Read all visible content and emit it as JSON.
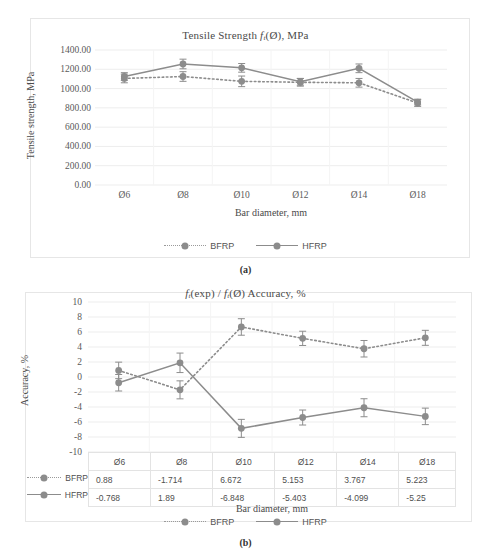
{
  "figure_a": {
    "caption": "(a)",
    "title_prefix": "Tensile Strength ",
    "title_f": "f",
    "title_sub": "t",
    "title_suffix": "(Ø), MPa",
    "xlabel": "Bar diameter, mm",
    "ylabel": "Tensile strength, MPa",
    "yticks": [
      "1400.00",
      "1200.00",
      "1000.00",
      "800.00",
      "600.00",
      "400.00",
      "200.00",
      "0.00"
    ],
    "xticks": [
      "Ø6",
      "Ø8",
      "Ø10",
      "Ø12",
      "Ø14",
      "Ø18"
    ],
    "legend": [
      {
        "label": "BFRP",
        "style": "dotted"
      },
      {
        "label": "HFRP",
        "style": "solid"
      }
    ]
  },
  "figure_b": {
    "caption": "(b)",
    "title_f1": "f",
    "title_sub1": "t",
    "title_mid": "(exp) / ",
    "title_f2": "f",
    "title_sub2": "t",
    "title_suffix": "(Ø) Accuracy, %",
    "xlabel": "Bar diameter, mm",
    "ylabel": "Accuracy, %",
    "yticks": [
      "10",
      "8",
      "6",
      "4",
      "2",
      "0",
      "-2",
      "-4",
      "-6",
      "-8",
      "-10"
    ],
    "categories": [
      "Ø6",
      "Ø8",
      "Ø10",
      "Ø12",
      "Ø14",
      "Ø18"
    ],
    "table_rows": [
      {
        "label": "BFRP",
        "style": "dotted",
        "values": [
          "0.88",
          "-1.714",
          "6.672",
          "5.153",
          "3.767",
          "5.223"
        ]
      },
      {
        "label": "HFRP",
        "style": "solid",
        "values": [
          "-0.768",
          "1.89",
          "-6.848",
          "-5.403",
          "-4.099",
          "-5.25"
        ]
      }
    ],
    "legend": [
      {
        "label": "BFRP",
        "style": "dotted"
      },
      {
        "label": "HFRP",
        "style": "solid"
      }
    ]
  },
  "colors": {
    "series": "#8c8c8c",
    "grid": "#ededed",
    "panel_border": "#e6e6e6",
    "text": "#4a4a4a"
  },
  "chart_data": [
    {
      "type": "line",
      "id": "a",
      "title": "Tensile Strength ft(Ø), MPa",
      "xlabel": "Bar diameter, mm",
      "ylabel": "Tensile strength, MPa",
      "categories": [
        "Ø6",
        "Ø8",
        "Ø10",
        "Ø12",
        "Ø14",
        "Ø18"
      ],
      "ylim": [
        0,
        1400
      ],
      "ytick_step": 200,
      "grid": true,
      "legend_position": "bottom",
      "series": [
        {
          "name": "BFRP",
          "style": "dotted",
          "values": [
            1105,
            1125,
            1075,
            1065,
            1060,
            850
          ],
          "error": [
            45,
            50,
            55,
            40,
            45,
            35
          ]
        },
        {
          "name": "HFRP",
          "style": "solid",
          "values": [
            1125,
            1255,
            1215,
            1070,
            1210,
            860
          ],
          "error": [
            40,
            50,
            45,
            35,
            45,
            30
          ]
        }
      ]
    },
    {
      "type": "line",
      "id": "b",
      "title": "ft(exp) / ft(Ø) Accuracy, %",
      "xlabel": "Bar diameter, mm",
      "ylabel": "Accuracy, %",
      "categories": [
        "Ø6",
        "Ø8",
        "Ø10",
        "Ø12",
        "Ø14",
        "Ø18"
      ],
      "ylim": [
        -10,
        10
      ],
      "ytick_step": 2,
      "grid": true,
      "legend_position": "bottom",
      "series": [
        {
          "name": "BFRP",
          "style": "dotted",
          "values": [
            0.88,
            -1.714,
            6.672,
            5.153,
            3.767,
            5.223
          ],
          "error": [
            1.1,
            1.2,
            1.1,
            0.95,
            1.1,
            1.0
          ]
        },
        {
          "name": "HFRP",
          "style": "solid",
          "values": [
            -0.768,
            1.89,
            -6.848,
            -5.403,
            -4.099,
            -5.25
          ],
          "error": [
            1.1,
            1.3,
            1.2,
            1.0,
            1.2,
            1.1
          ]
        }
      ]
    }
  ]
}
